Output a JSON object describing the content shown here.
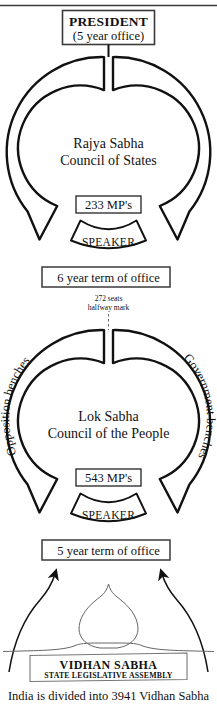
{
  "diagram": {
    "title_caption": "India is divided into 3941 Vidhan Sabha",
    "top_rule": "horizontal-rule"
  },
  "president": {
    "title": "PRESIDENT",
    "subtitle": "(5 year office)"
  },
  "rajya_sabha": {
    "name_line1": "Rajya Sabha",
    "name_line2": "Council of States",
    "seats_label": "233 MP's",
    "speaker_label": "SPEAKER",
    "term_label": "6 year term of office"
  },
  "halfway": {
    "line1": "272 seats",
    "line2": "halfway mark"
  },
  "lok_sabha": {
    "name_line1": "Lok Sabha",
    "name_line2": "Council of the People",
    "seats_label": "543 MP's",
    "speaker_label": "SPEAKER",
    "term_label": "5 year term of office",
    "left_bench_label": "Opposition benches",
    "right_bench_label": "Government benches"
  },
  "vidhan_sabha": {
    "title": "VIDHAN SABHA",
    "subtitle": "STATE LEGISLATIVE ASSEMBLY"
  },
  "colors": {
    "ink": "#111111",
    "paper": "#ffffff",
    "thin_line": "#555555",
    "box_border": "#444444"
  }
}
